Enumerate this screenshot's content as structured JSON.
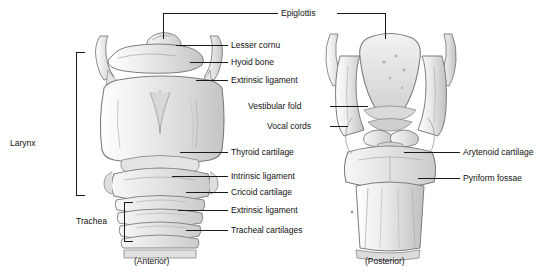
{
  "figure": {
    "background": "#ffffff",
    "line_color": "#1a1a1a",
    "art_fill_light": "#f1f1f1",
    "art_fill_mid": "#dcdcdc",
    "art_fill_dark": "#c2c2c2",
    "art_stroke": "#8d8d8d"
  },
  "left_brackets": [
    {
      "label": "Larynx"
    },
    {
      "label": "Trachea"
    }
  ],
  "callouts": [
    {
      "label": "Epiglottis"
    },
    {
      "label": "Lesser cornu"
    },
    {
      "label": "Hyoid bone"
    },
    {
      "label": "Extrinsic ligament"
    },
    {
      "label": "Vestibular fold"
    },
    {
      "label": "Vocal cords"
    },
    {
      "label": "Thyroid cartilage"
    },
    {
      "label": "Intrinsic ligament"
    },
    {
      "label": "Cricoid cartilage"
    },
    {
      "label": "Extrinsic ligament"
    },
    {
      "label": "Tracheal cartilages"
    },
    {
      "label": "Arytenoid cartilage"
    },
    {
      "label": "Pyriform fossae"
    }
  ],
  "captions": [
    {
      "label": "(Anterior)"
    },
    {
      "label": "(Posterior)"
    }
  ]
}
